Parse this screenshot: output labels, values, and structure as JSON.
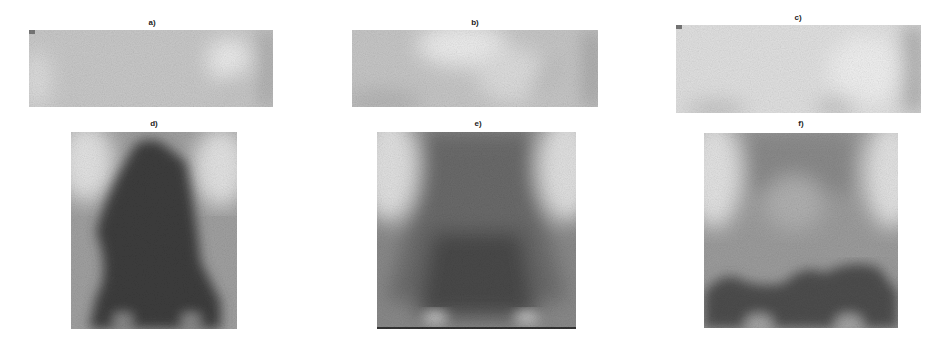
{
  "figure": {
    "panels": [
      {
        "id": "a",
        "label": "a)",
        "description": "light grey x-ray strip, bright rounded bone edge at right"
      },
      {
        "id": "b",
        "label": "b)",
        "description": "light grey x-ray strip, bright arcs top-center and right"
      },
      {
        "id": "c",
        "label": "c)",
        "description": "very light x-ray strip, darker right edge and lower bumps"
      },
      {
        "id": "d",
        "label": "d)",
        "description": "x-ray knee, very dark central mass with light corners"
      },
      {
        "id": "e",
        "label": "e)",
        "description": "x-ray knee, medium-dark funnel shape with two light spots at bottom"
      },
      {
        "id": "f",
        "label": "f)",
        "description": "x-ray knee, medium grey with dark band near bottom"
      }
    ]
  },
  "colors": {
    "background": "#ffffff",
    "light": "#e6e6e6",
    "mid": "#a8a8a8",
    "dark": "#3a3a3a"
  }
}
